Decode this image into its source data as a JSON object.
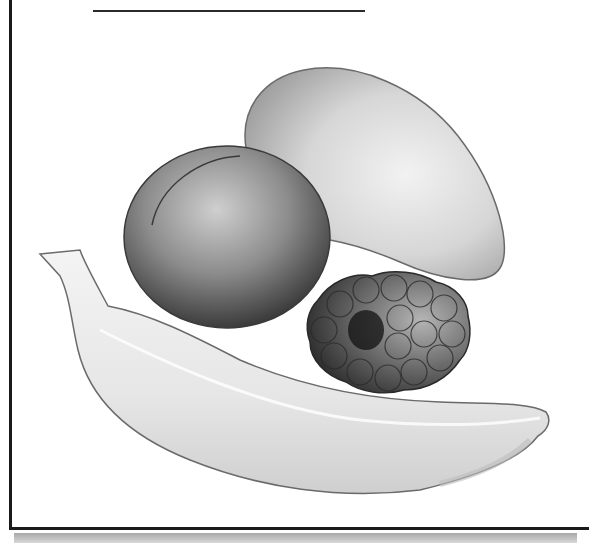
{
  "worksheet": {
    "answer_line": "",
    "illustration": {
      "subject": "fruit still life",
      "style": "grayscale",
      "items": [
        {
          "name": "mango"
        },
        {
          "name": "peach"
        },
        {
          "name": "raspberry"
        },
        {
          "name": "banana"
        }
      ]
    }
  }
}
